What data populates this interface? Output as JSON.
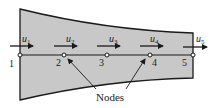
{
  "figure": {
    "fill_color": "#c8c8c8",
    "stroke_color": "#1a1a1a",
    "nodes": [
      {
        "id": "1",
        "label": "1",
        "disp": "u",
        "sub": "1",
        "x": 20
      },
      {
        "id": "2",
        "label": "2",
        "disp": "u",
        "sub": "2",
        "x": 64
      },
      {
        "id": "3",
        "label": "3",
        "disp": "u",
        "sub": "3",
        "x": 107
      },
      {
        "id": "4",
        "label": "4",
        "disp": "u",
        "sub": "4",
        "x": 150
      },
      {
        "id": "5",
        "label": "5",
        "disp": "u",
        "sub": "5",
        "x": 193
      }
    ],
    "callout_label": "Nodes"
  }
}
